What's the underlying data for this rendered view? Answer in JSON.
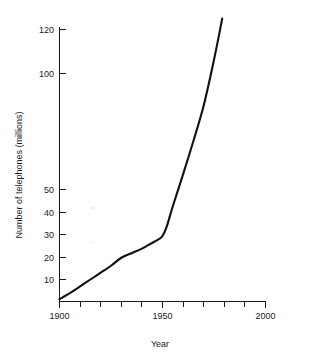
{
  "chart_data": {
    "type": "line",
    "title": "",
    "xlabel": "Year",
    "ylabel": "Number of telephones (millions)",
    "xlim": [
      1900,
      2000
    ],
    "ylim": [
      0,
      124
    ],
    "grid": false,
    "legend": null,
    "x_ticks_major": [
      1900,
      1950,
      2000
    ],
    "x_tick_labels": [
      "1900",
      "1950",
      "2000"
    ],
    "x_ticks_minor": [
      1910,
      1920,
      1930,
      1940,
      1960,
      1970,
      1980,
      1990
    ],
    "y_ticks": [
      10,
      20,
      30,
      40,
      50,
      100,
      120
    ],
    "y_tick_labels": [
      "10",
      "20",
      "30",
      "40",
      "50",
      "100",
      "120"
    ],
    "series": [
      {
        "name": "Number of telephones (millions)",
        "color": "#111111",
        "x": [
          1900,
          1905,
          1910,
          1915,
          1920,
          1925,
          1930,
          1935,
          1940,
          1943,
          1946,
          1948,
          1950,
          1952,
          1955,
          1960,
          1965,
          1970,
          1975,
          1979
        ],
        "y": [
          1.4,
          4.0,
          7.0,
          10.0,
          13.0,
          16.0,
          19.5,
          21.5,
          23.5,
          25.0,
          26.5,
          27.5,
          29.0,
          33.0,
          42.0,
          56.0,
          70.5,
          86.0,
          106.0,
          124.0
        ]
      }
    ]
  },
  "axis_labels": {
    "x_title": "Year",
    "y_title": "Number of telephones (millions)"
  },
  "colors": {
    "curve": "#111111",
    "axis": "#1a1a1a",
    "background": "#ffffff"
  }
}
